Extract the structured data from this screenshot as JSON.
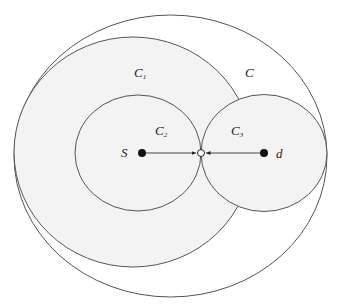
{
  "diagram": {
    "labels": {
      "outer": "C",
      "c1": "C",
      "c1_sub": "1",
      "c2": "C",
      "c2_sub": "2",
      "c3": "C",
      "c3_sub": "3",
      "source": "S",
      "dest": "d"
    },
    "colors": {
      "stroke": "#555555",
      "fill_region": "#f3f3f3",
      "background": "#ffffff",
      "node": "#111111"
    }
  }
}
